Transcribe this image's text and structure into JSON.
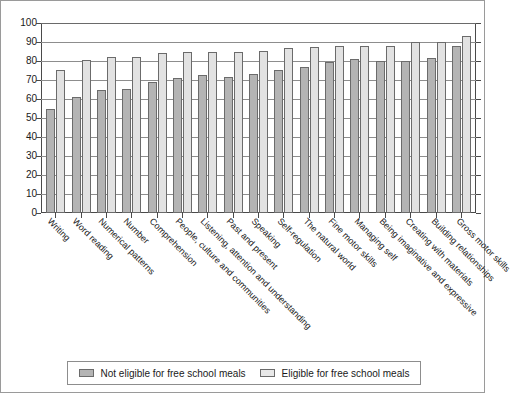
{
  "chart_data": {
    "type": "bar",
    "title": "",
    "xlabel": "",
    "ylabel": "",
    "ylim": [
      0,
      100
    ],
    "yticks": [
      0,
      10,
      20,
      30,
      40,
      50,
      60,
      70,
      80,
      90,
      100
    ],
    "grid": true,
    "legend_position": "bottom",
    "categories": [
      "Writing",
      "Word reading",
      "Numerical patterns",
      "Number",
      "Comprehension",
      "People, culture and communities",
      "Listening, attention and understanding",
      "Past and present",
      "Speaking",
      "Self-regulation",
      "The natural world",
      "Fine motor skills",
      "Managing self",
      "Being imaginative and expressive",
      "Creating with materials",
      "Building relationships",
      "Gross motor skills"
    ],
    "series": [
      {
        "name": "Not eligible for free school meals",
        "color": "#b4b4b4",
        "values": [
          55,
          61,
          64.5,
          65.5,
          69,
          71,
          72.5,
          71.5,
          73,
          75.5,
          77,
          79.5,
          81,
          80,
          80,
          81.5,
          88
        ]
      },
      {
        "name": "Eligible for free school meals",
        "color": "#e2e2e2",
        "values": [
          75.5,
          80.5,
          82,
          82,
          84,
          85,
          85,
          85,
          85.5,
          87,
          87.5,
          88,
          88,
          88,
          90,
          90,
          93
        ]
      }
    ]
  },
  "legend": {
    "items": [
      {
        "label": "Not eligible for free school meals",
        "swatch": "dark"
      },
      {
        "label": "Eligible for free school meals",
        "swatch": "light"
      }
    ]
  }
}
